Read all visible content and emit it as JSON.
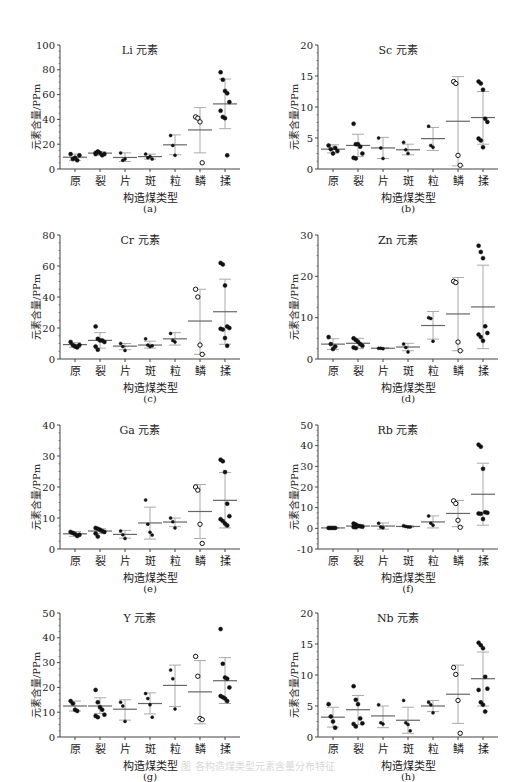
{
  "figure": {
    "caption": "图 各构造煤类型元素含量分布特征",
    "x_axis_title": "构造煤类型",
    "y_axis_title": "元素含量/PPm",
    "categories": [
      "原",
      "裂",
      "片",
      "斑",
      "粒",
      "鳞",
      "揉"
    ]
  },
  "chart_data": [
    {
      "type": "scatter",
      "panel": "(a)",
      "title": "Li 元素",
      "xlabel": "构造煤类型",
      "ylabel": "元素含量/PPm",
      "ylim": [
        0,
        100
      ],
      "yticks": [
        0,
        20,
        40,
        60,
        80,
        100
      ],
      "categories": [
        "原",
        "裂",
        "片",
        "斑",
        "粒",
        "鳞",
        "揉"
      ],
      "points": [
        [
          12,
          8,
          9,
          7,
          11
        ],
        [
          12,
          14,
          13,
          11,
          12,
          13,
          14
        ],
        [
          13,
          7,
          8
        ],
        [
          12,
          9,
          10,
          8
        ],
        [
          27,
          19,
          11
        ],
        [
          42,
          41,
          38,
          5
        ],
        [
          78,
          72,
          63,
          61,
          54,
          47,
          42,
          41,
          11
        ]
      ],
      "mean": [
        9.5,
        12.8,
        9.3,
        10,
        19.5,
        31.5,
        52.5
      ],
      "sd_upper": [
        12,
        14,
        13,
        12,
        27.5,
        49.5,
        72.5
      ],
      "sd_lower": [
        7,
        11,
        6,
        8,
        11.5,
        13,
        32.5
      ],
      "hollow_markers_category": "鳞"
    },
    {
      "type": "scatter",
      "panel": "(b)",
      "title": "Sc 元素",
      "xlabel": "构造煤类型",
      "ylabel": "元素含量/PPm",
      "ylim": [
        0,
        20
      ],
      "yticks": [
        0,
        5,
        10,
        15,
        20
      ],
      "categories": [
        "原",
        "裂",
        "片",
        "斑",
        "粒",
        "鳞",
        "揉"
      ],
      "points": [
        [
          3.8,
          3.2,
          2.5,
          3.4,
          2.9
        ],
        [
          7.3,
          4.0,
          4.0,
          3.6,
          2.5,
          1.8,
          1.7
        ],
        [
          5.0,
          3.4,
          1.7
        ],
        [
          4.3,
          3.1,
          2.5
        ],
        [
          6.9,
          3.8,
          3.5
        ],
        [
          14.1,
          13.8,
          2.2,
          0.6
        ],
        [
          14.1,
          13.8,
          12.8,
          8.1,
          7.6,
          4.9,
          4.6,
          3.5
        ]
      ],
      "mean": [
        3.2,
        3.8,
        3.4,
        3.1,
        4.9,
        7.7,
        8.3
      ],
      "sd_upper": [
        3.9,
        5.6,
        5.1,
        4.0,
        6.7,
        14.9,
        12.5
      ],
      "sd_lower": [
        2.6,
        2.0,
        1.7,
        2.3,
        3.0,
        0.5,
        4.0
      ],
      "hollow_markers_category": "鳞"
    },
    {
      "type": "scatter",
      "panel": "(c)",
      "title": "Cr 元素",
      "xlabel": "构造煤类型",
      "ylabel": "元素含量/PPm",
      "ylim": [
        0,
        80
      ],
      "yticks": [
        0,
        20,
        40,
        60,
        80
      ],
      "categories": [
        "原",
        "裂",
        "片",
        "斑",
        "粒",
        "鳞",
        "揉"
      ],
      "points": [
        [
          11,
          9,
          8,
          7.5,
          9
        ],
        [
          21,
          13,
          12,
          12,
          11,
          8,
          6
        ],
        [
          10,
          8,
          5.5
        ],
        [
          13,
          9,
          8,
          8.5
        ],
        [
          16.5,
          12,
          11
        ],
        [
          45,
          40,
          9,
          3
        ],
        [
          62,
          61,
          47.5,
          21,
          20,
          19.5,
          19,
          13.5,
          8.5
        ]
      ],
      "mean": [
        9.3,
        12,
        8.3,
        9,
        13,
        24.5,
        30.5
      ],
      "sd_upper": [
        10.5,
        17,
        10,
        11.5,
        17,
        45,
        51.5
      ],
      "sd_lower": [
        7.5,
        7,
        6,
        7,
        9,
        3,
        9.5
      ],
      "hollow_markers_category": "鳞"
    },
    {
      "type": "scatter",
      "panel": "(d)",
      "title": "Zn 元素",
      "xlabel": "构造煤类型",
      "ylabel": "元素含量/PPm",
      "ylim": [
        0,
        30
      ],
      "yticks": [
        0,
        10,
        20,
        30
      ],
      "categories": [
        "原",
        "裂",
        "片",
        "斑",
        "粒",
        "鳞",
        "揉"
      ],
      "points": [
        [
          5.3,
          3.6,
          2.4,
          3.0
        ],
        [
          5.0,
          4.6,
          4.2,
          3.6,
          3.2,
          2.8,
          2.6
        ],
        [
          2.6,
          2.6,
          2.5
        ],
        [
          3.6,
          2.8,
          1.7
        ],
        [
          10.0,
          9.8,
          4.3
        ],
        [
          18.8,
          18.5,
          4.1,
          2.0
        ],
        [
          27.4,
          25.9,
          24.4,
          7.9,
          6.3,
          5.9,
          5.3,
          4.4
        ]
      ],
      "mean": [
        3.6,
        3.8,
        2.6,
        2.9,
        8.1,
        10.9,
        12.6
      ],
      "sd_upper": [
        4.9,
        5.0,
        2.7,
        3.8,
        11.5,
        19.7,
        22.7
      ],
      "sd_lower": [
        2.3,
        2.5,
        2.5,
        2.0,
        4.8,
        2.0,
        2.5
      ],
      "hollow_markers_category": "鳞"
    },
    {
      "type": "scatter",
      "panel": "(e)",
      "title": "Ga 元素",
      "xlabel": "构造煤类型",
      "ylabel": "元素含量/PPm",
      "ylim": [
        0,
        40
      ],
      "yticks": [
        0,
        10,
        20,
        30,
        40
      ],
      "categories": [
        "原",
        "裂",
        "片",
        "斑",
        "粒",
        "鳞",
        "揉"
      ],
      "points": [
        [
          5.5,
          5.2,
          4.8,
          4.2,
          4.6
        ],
        [
          6.8,
          6.5,
          6.2,
          5.8,
          5.5,
          5.0,
          4.0
        ],
        [
          5.8,
          4.6,
          3.4
        ],
        [
          15.8,
          8.0,
          5.4,
          4.5
        ],
        [
          10.0,
          8.8,
          6.8
        ],
        [
          20,
          19,
          8,
          1.8
        ],
        [
          28.8,
          28.3,
          24.8,
          14.6,
          10.6,
          9.6,
          9.0,
          8.2,
          7.6
        ]
      ],
      "mean": [
        4.9,
        5.8,
        4.7,
        8.4,
        8.7,
        12.1,
        15.7
      ],
      "sd_upper": [
        5.6,
        6.5,
        6.0,
        13.5,
        10.0,
        20.8,
        24.7
      ],
      "sd_lower": [
        4.1,
        5.0,
        3.5,
        3.2,
        7.2,
        3.4,
        6.8
      ],
      "hollow_markers_category": "鳞"
    },
    {
      "type": "scatter",
      "panel": "(f)",
      "title": "Rb 元素",
      "xlabel": "构造煤类型",
      "ylabel": "元素含量/PPm",
      "ylim": [
        -10,
        50
      ],
      "yticks": [
        -10,
        0,
        10,
        20,
        30,
        40,
        50
      ],
      "categories": [
        "原",
        "裂",
        "片",
        "斑",
        "粒",
        "鳞",
        "揉"
      ],
      "points": [
        [
          0.2,
          0.2,
          0.2,
          0.2
        ],
        [
          2.3,
          1.8,
          1.2,
          1.0,
          0.8,
          0.6,
          0.5
        ],
        [
          2.5,
          0.6,
          0.3
        ],
        [
          1.3,
          0.9,
          0.7,
          0.6
        ],
        [
          6.0,
          2.5,
          1.5
        ],
        [
          13.3,
          12.0,
          3.9,
          0.5
        ],
        [
          40.5,
          39.5,
          28.8,
          7.8,
          7.5,
          7.2,
          7.0,
          4.5
        ]
      ],
      "mean": [
        0.2,
        1.1,
        1.1,
        0.9,
        3.1,
        7.2,
        16.5
      ],
      "sd_upper": [
        0.2,
        1.9,
        2.6,
        1.3,
        6.0,
        13.5,
        31.5
      ],
      "sd_lower": [
        0.2,
        0.3,
        -0.4,
        0.5,
        0.2,
        0.8,
        1.5
      ],
      "hollow_markers_category": "鳞"
    },
    {
      "type": "scatter",
      "panel": "(g)",
      "title": "Y 元素",
      "xlabel": "构造煤类型",
      "ylabel": "元素含量/PPm",
      "ylim": [
        0,
        50
      ],
      "yticks": [
        0,
        10,
        20,
        30,
        40,
        50
      ],
      "categories": [
        "原",
        "裂",
        "片",
        "斑",
        "粒",
        "鳞",
        "揉"
      ],
      "points": [
        [
          14.5,
          13.5,
          11,
          10.5
        ],
        [
          19,
          14,
          12,
          11,
          9,
          8.5,
          8
        ],
        [
          14,
          12.5,
          6.3
        ],
        [
          17.5,
          15.5,
          13,
          8
        ],
        [
          27,
          23.5,
          11.3
        ],
        [
          32.5,
          24.5,
          7.5,
          7
        ],
        [
          43.5,
          29.5,
          24,
          23.5,
          20,
          16.5,
          16,
          15.5,
          14.5
        ]
      ],
      "mean": [
        12.5,
        12.5,
        11.2,
        13.5,
        20.8,
        18.2,
        22.7
      ],
      "sd_upper": [
        14.5,
        15.8,
        15.0,
        17.8,
        29.0,
        30.8,
        32.0
      ],
      "sd_lower": [
        10.5,
        9.5,
        6.8,
        9.3,
        12.3,
        5.3,
        13.5
      ],
      "hollow_markers_category": "鳞"
    },
    {
      "type": "scatter",
      "panel": "(h)",
      "title": "Nb 元素",
      "xlabel": "构造煤类型",
      "ylabel": "元素含量/PPm",
      "ylim": [
        0,
        20
      ],
      "yticks": [
        0,
        5,
        10,
        15,
        20
      ],
      "categories": [
        "原",
        "裂",
        "片",
        "斑",
        "粒",
        "鳞",
        "揉"
      ],
      "points": [
        [
          5.3,
          3.3,
          2.5,
          1.5
        ],
        [
          8.2,
          6.0,
          5.3,
          3.0,
          2.2,
          2.1,
          1.7
        ],
        [
          5.2,
          2.3,
          2.1
        ],
        [
          5.9,
          2.3,
          2.0,
          1.0
        ],
        [
          5.6,
          5.2,
          3.9
        ],
        [
          11.2,
          10.1,
          5.9,
          0.6
        ],
        [
          15.2,
          14.8,
          14.3,
          9.7,
          7.8,
          7.6,
          5.6,
          5.2,
          4.1
        ]
      ],
      "mean": [
        3.2,
        4.4,
        3.4,
        2.7,
        5.0,
        6.9,
        9.4
      ],
      "sd_upper": [
        4.8,
        6.7,
        5.0,
        4.8,
        5.9,
        11.6,
        13.7
      ],
      "sd_lower": [
        1.6,
        2.0,
        1.5,
        0.6,
        4.1,
        2.2,
        5.0
      ],
      "hollow_markers_category": "鳞"
    }
  ],
  "colors": {
    "axis": "#444444",
    "error_bar": "#aaaaaa",
    "mean_line": "#666666",
    "marker": "#111111"
  }
}
